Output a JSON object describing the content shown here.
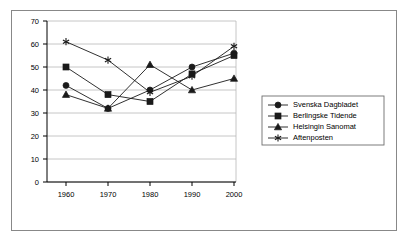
{
  "chart_data": {
    "type": "line",
    "title": "",
    "xlabel": "",
    "ylabel": "",
    "categories": [
      "1960",
      "1970",
      "1980",
      "1990",
      "2000"
    ],
    "x": [
      1960,
      1970,
      1980,
      1990,
      2000
    ],
    "ylim": [
      0,
      70
    ],
    "yticks": [
      0,
      10,
      20,
      30,
      40,
      50,
      60,
      70
    ],
    "ytick_labels": [
      "0",
      "10",
      "20",
      "30",
      "40",
      "50",
      "60",
      "70"
    ],
    "xtick_labels": [
      "1960",
      "1970",
      "1980",
      "1990",
      "2000"
    ],
    "grid": true,
    "legend_position": "right",
    "series": [
      {
        "name": "Svenska Dagbladet",
        "marker": "circle",
        "values": [
          42,
          32,
          40,
          50,
          56
        ]
      },
      {
        "name": "Berlingske Tidende",
        "marker": "square",
        "values": [
          50,
          38,
          35,
          47,
          55
        ]
      },
      {
        "name": "Helsingin Sanomat",
        "marker": "triangle",
        "values": [
          38,
          32,
          51,
          40,
          45
        ]
      },
      {
        "name": "Aftenposten",
        "marker": "star",
        "values": [
          61,
          53,
          39,
          46,
          59
        ]
      }
    ]
  },
  "legend": {
    "entries": [
      {
        "label": "Svenska Dagbladet",
        "marker": "circle"
      },
      {
        "label": "Berlingske Tidende",
        "marker": "square"
      },
      {
        "label": "Helsingin Sanomat",
        "marker": "triangle"
      },
      {
        "label": "Aftenposten",
        "marker": "star"
      }
    ]
  },
  "axes": {
    "y_labels": [
      "70",
      "60",
      "50",
      "40",
      "30",
      "20",
      "10",
      "0"
    ],
    "x_labels": [
      "1960",
      "1970",
      "1980",
      "1990",
      "2000"
    ]
  }
}
